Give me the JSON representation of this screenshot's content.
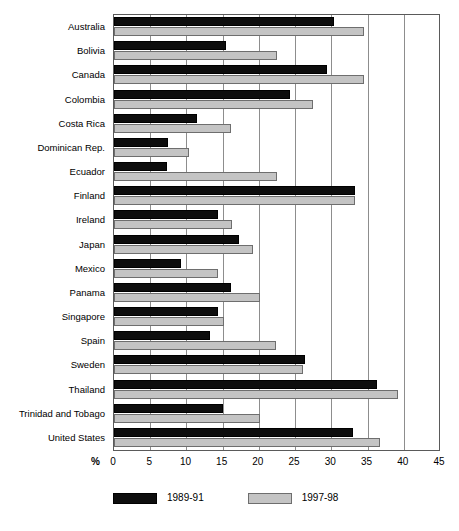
{
  "chart_data": {
    "type": "bar",
    "orientation": "horizontal",
    "title": "",
    "xlabel": "%",
    "ylabel": "",
    "xlim": [
      0,
      45
    ],
    "xticks": [
      0,
      5,
      10,
      15,
      20,
      25,
      30,
      35,
      40,
      45
    ],
    "xtick_labels": [
      "0",
      "5",
      "10",
      "15",
      "20",
      "25",
      "30",
      "35",
      "40",
      "45"
    ],
    "grid": true,
    "grid_axis": "x",
    "legend_position": "bottom",
    "categories": [
      "Australia",
      "Bolivia",
      "Canada",
      "Colombia",
      "Costa Rica",
      "Dominican Rep.",
      "Ecuador",
      "Finland",
      "Ireland",
      "Japan",
      "Mexico",
      "Panama",
      "Singapore",
      "Spain",
      "Sweden",
      "Thailand",
      "Trinidad and Tobago",
      "United States"
    ],
    "series": [
      {
        "name": "1989-91",
        "color": "#0d0d0d",
        "values": [
          30.4,
          15.4,
          29.4,
          24.3,
          11.4,
          7.4,
          7.3,
          33.3,
          14.3,
          17.2,
          9.2,
          16.1,
          14.3,
          13.2,
          26.3,
          36.3,
          15.1,
          33.0
        ]
      },
      {
        "name": "1997-98",
        "color": "#c4c4c4",
        "values": [
          34.5,
          22.5,
          34.5,
          27.5,
          16.2,
          10.3,
          22.5,
          33.3,
          16.3,
          19.2,
          14.3,
          20.2,
          15.2,
          22.4,
          26.1,
          39.2,
          20.2,
          36.7
        ]
      }
    ]
  }
}
